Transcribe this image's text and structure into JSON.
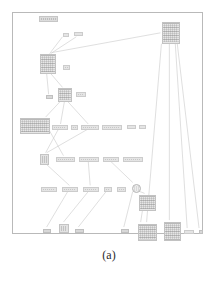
{
  "figure": {
    "caption": "(a)",
    "alt": "Graph diagram of nodes connected by edges inside a rectangular frame",
    "frame": {
      "x": 12,
      "y": 12,
      "width": 191,
      "height": 222,
      "border_color": "#b9b9b9"
    },
    "colors": {
      "background": "#ffffff",
      "frame_border": "#b9b9b9",
      "edge": "#c9c9c9",
      "node_fill": "#e2e2e2",
      "node_border": "#c4c4c4",
      "leaf_fill": "#d8d8d8",
      "caption_text": "#2b2b2b"
    },
    "legibility_note": "illegible"
  },
  "nodes": [
    {
      "id": "n-title",
      "kind": "title",
      "label": "",
      "x": 38,
      "y": 15,
      "w": 19,
      "h": 6
    },
    {
      "id": "n-edge-lbl-1",
      "kind": "label",
      "label": "",
      "x": 62,
      "y": 32,
      "w": 6,
      "h": 4
    },
    {
      "id": "n-edge-lbl-2",
      "kind": "label",
      "label": "",
      "x": 73,
      "y": 31,
      "w": 9,
      "h": 4
    },
    {
      "id": "n-mid-upper",
      "kind": "table",
      "label": "",
      "x": 39,
      "y": 53,
      "w": 16,
      "h": 20
    },
    {
      "id": "n-lbl-right-1",
      "kind": "label",
      "label": "",
      "x": 62,
      "y": 64,
      "w": 7,
      "h": 5
    },
    {
      "id": "n-top-right",
      "kind": "table",
      "label": "",
      "x": 161,
      "y": 21,
      "w": 18,
      "h": 22
    },
    {
      "id": "n-leaf-left-1",
      "kind": "leaf",
      "label": "",
      "x": 45,
      "y": 94,
      "w": 7,
      "h": 4
    },
    {
      "id": "n-small-tbl",
      "kind": "table",
      "label": "",
      "x": 57,
      "y": 87,
      "w": 14,
      "h": 14
    },
    {
      "id": "n-lbl-hl",
      "kind": "label",
      "label": "",
      "x": 75,
      "y": 91,
      "w": 10,
      "h": 5
    },
    {
      "id": "n-big-left",
      "kind": "table",
      "label": "",
      "x": 19,
      "y": 117,
      "w": 30,
      "h": 16
    },
    {
      "id": "n-row1-a",
      "kind": "label",
      "label": "",
      "x": 51,
      "y": 124,
      "w": 16,
      "h": 5
    },
    {
      "id": "n-row1-b",
      "kind": "label",
      "label": "",
      "x": 70,
      "y": 124,
      "w": 7,
      "h": 5
    },
    {
      "id": "n-row1-c",
      "kind": "label",
      "label": "",
      "x": 80,
      "y": 124,
      "w": 18,
      "h": 5
    },
    {
      "id": "n-row1-d",
      "kind": "label",
      "label": "",
      "x": 101,
      "y": 124,
      "w": 20,
      "h": 5
    },
    {
      "id": "n-row1-e",
      "kind": "label",
      "label": "",
      "x": 126,
      "y": 124,
      "w": 9,
      "h": 4
    },
    {
      "id": "n-row1-f",
      "kind": "label",
      "label": "",
      "x": 138,
      "y": 124,
      "w": 7,
      "h": 4
    },
    {
      "id": "n-mid-small",
      "kind": "box",
      "label": "",
      "x": 39,
      "y": 153,
      "w": 9,
      "h": 11
    },
    {
      "id": "n-row2-a",
      "kind": "label",
      "label": "",
      "x": 55,
      "y": 156,
      "w": 19,
      "h": 5
    },
    {
      "id": "n-row2-b",
      "kind": "label",
      "label": "",
      "x": 78,
      "y": 156,
      "w": 20,
      "h": 5
    },
    {
      "id": "n-row2-c",
      "kind": "label",
      "label": "",
      "x": 102,
      "y": 156,
      "w": 16,
      "h": 5
    },
    {
      "id": "n-row2-d",
      "kind": "label",
      "label": "",
      "x": 122,
      "y": 156,
      "w": 20,
      "h": 5
    },
    {
      "id": "n-row3-a",
      "kind": "label",
      "label": "",
      "x": 40,
      "y": 186,
      "w": 16,
      "h": 5
    },
    {
      "id": "n-row3-b",
      "kind": "label",
      "label": "",
      "x": 61,
      "y": 186,
      "w": 16,
      "h": 5
    },
    {
      "id": "n-row3-c",
      "kind": "label",
      "label": "",
      "x": 82,
      "y": 186,
      "w": 16,
      "h": 5
    },
    {
      "id": "n-row3-d",
      "kind": "label",
      "label": "",
      "x": 103,
      "y": 186,
      "w": 8,
      "h": 5
    },
    {
      "id": "n-row3-e",
      "kind": "label",
      "label": "",
      "x": 116,
      "y": 186,
      "w": 9,
      "h": 5
    },
    {
      "id": "n-join-circle",
      "kind": "round",
      "label": "",
      "x": 131,
      "y": 183,
      "w": 9,
      "h": 9
    },
    {
      "id": "n-right-tbl-1",
      "kind": "table",
      "label": "",
      "x": 138,
      "y": 194,
      "w": 17,
      "h": 16
    },
    {
      "id": "n-right-tbl-2",
      "kind": "table",
      "label": "",
      "x": 137,
      "y": 223,
      "w": 19,
      "h": 17
    },
    {
      "id": "n-far-tbl",
      "kind": "table",
      "label": "",
      "x": 163,
      "y": 221,
      "w": 17,
      "h": 19
    },
    {
      "id": "n-leaf-b1",
      "kind": "leaf",
      "label": "",
      "x": 42,
      "y": 228,
      "w": 8,
      "h": 4
    },
    {
      "id": "n-leaf-b2",
      "kind": "box",
      "label": "",
      "x": 58,
      "y": 223,
      "w": 10,
      "h": 9
    },
    {
      "id": "n-leaf-b3",
      "kind": "leaf",
      "label": "",
      "x": 74,
      "y": 228,
      "w": 9,
      "h": 4
    },
    {
      "id": "n-leaf-b4",
      "kind": "leaf",
      "label": "",
      "x": 120,
      "y": 228,
      "w": 8,
      "h": 4
    },
    {
      "id": "n-leaf-b5",
      "kind": "label",
      "label": "",
      "x": 183,
      "y": 229,
      "w": 10,
      "h": 4
    },
    {
      "id": "n-leaf-b6",
      "kind": "leaf",
      "label": "",
      "x": 198,
      "y": 229,
      "w": 4,
      "h": 4
    }
  ],
  "edges": [
    {
      "from": "n-edge-lbl-1",
      "to": "n-mid-upper",
      "path": "M62,36 L49,53"
    },
    {
      "from": "n-edge-lbl-2",
      "to": "n-mid-upper",
      "path": "M76,36 L50,53"
    },
    {
      "from": "n-top-right",
      "to": "n-mid-upper",
      "path": "M161,32 L51,52"
    },
    {
      "from": "n-mid-upper",
      "to": "n-leaf-left-1",
      "path": "M46,73 L48,94"
    },
    {
      "from": "n-mid-upper",
      "to": "n-small-tbl",
      "path": "M50,73 L62,87"
    },
    {
      "from": "n-small-tbl",
      "to": "n-big-left",
      "path": "M60,101 L45,117"
    },
    {
      "from": "n-small-tbl",
      "to": "n-row1-a",
      "path": "M64,101 L60,124"
    },
    {
      "from": "n-small-tbl",
      "to": "n-row1-c",
      "path": "M67,101 L88,124"
    },
    {
      "from": "n-big-left",
      "to": "n-row2-a",
      "path": "M49,131 L63,156"
    },
    {
      "from": "n-row1-c",
      "to": "n-mid-small",
      "path": "M88,129 L46,153"
    },
    {
      "from": "n-row1-a",
      "to": "n-mid-small",
      "path": "M58,129 L45,153"
    },
    {
      "from": "n-mid-small",
      "to": "n-row3-b",
      "path": "M45,164 L69,186"
    },
    {
      "from": "n-row2-b",
      "to": "n-row3-c",
      "path": "M88,161 L90,186"
    },
    {
      "from": "n-row2-c",
      "to": "n-join-circle",
      "path": "M110,161 L133,183"
    },
    {
      "from": "n-row3-b",
      "to": "n-leaf-b1",
      "path": "M68,191 L46,228"
    },
    {
      "from": "n-row3-c",
      "to": "n-leaf-b2",
      "path": "M89,191 L63,223"
    },
    {
      "from": "n-row3-d",
      "to": "n-leaf-b3",
      "path": "M107,191 L78,228"
    },
    {
      "from": "n-join-circle",
      "to": "n-right-tbl-1",
      "path": "M137,191 L145,194"
    },
    {
      "from": "n-join-circle",
      "to": "n-leaf-b4",
      "path": "M133,192 L124,228"
    },
    {
      "from": "n-right-tbl-1",
      "to": "n-right-tbl-2",
      "path": "M143,210 L141,223"
    },
    {
      "from": "n-top-right",
      "to": "n-far-tbl",
      "path": "M170,43 L170,221"
    },
    {
      "from": "n-top-right",
      "to": "n-leaf-b5",
      "path": "M176,43 L188,229"
    },
    {
      "from": "n-top-right",
      "to": "n-leaf-b6",
      "path": "M178,43 L200,229"
    },
    {
      "from": "n-top-right",
      "to": "n-right-tbl-2",
      "path": "M162,43 L147,223"
    }
  ]
}
